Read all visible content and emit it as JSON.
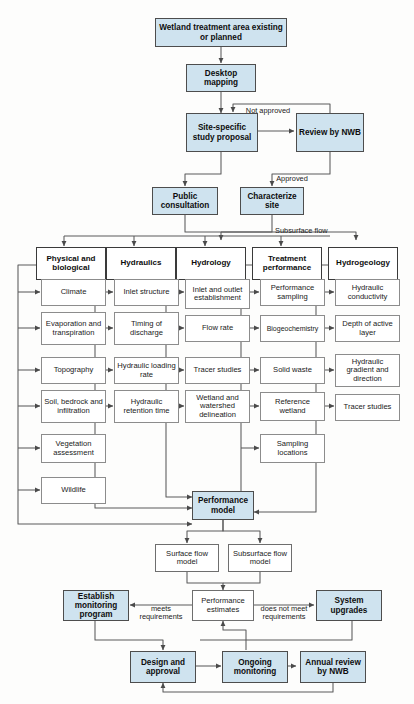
{
  "diagram": {
    "colors": {
      "fill_blue": "#cfe3ef",
      "border_dark": "#4d4d4d",
      "border_light": "#8c8c8c",
      "line": "#555555",
      "background": "#fdfdfc"
    }
  },
  "nodes": {
    "start": "Wetland treatment area existing or planned",
    "desktop_mapping": "Desktop mapping",
    "site_specific": "Site-specific study proposal",
    "review_nwb": "Review by NWB",
    "public_consultation": "Public consultation",
    "characterize_site": "Characterize site",
    "performance_model": "Performance model",
    "surface_flow_model": "Surface flow model",
    "subsurface_flow_model": "Subsurface flow model",
    "performance_estimates": "Performance estimates",
    "establish_monitoring": "Establish monitoring program",
    "system_upgrades": "System upgrades",
    "design_approval": "Design and approval",
    "ongoing_monitoring": "Ongoing monitoring",
    "annual_review": "Annual review by NWB"
  },
  "columns": [
    {
      "header": "Physical and biological",
      "items": [
        "Climate",
        "Evaporation and transpiration",
        "Topography",
        "Soil, bedrock and infiltration",
        "Vegetation assessment",
        "Wildlife"
      ]
    },
    {
      "header": "Hydraulics",
      "items": [
        "Inlet structure",
        "Timing of discharge",
        "Hydraulic loading rate",
        "Hydraulic retention time"
      ]
    },
    {
      "header": "Hydrology",
      "items": [
        "Inlet and outlet establishment",
        "Flow rate",
        "Tracer studies",
        "Wetland and watershed delineation"
      ]
    },
    {
      "header": "Treatment performance",
      "items": [
        "Performance sampling",
        "Biogeochemistry",
        "Solid waste",
        "Reference wetland",
        "Sampling locations"
      ]
    },
    {
      "header": "Hydrogeology",
      "items": [
        "Hydraulic conductivity",
        "Depth of active layer",
        "Hydraulic gradient and direction",
        "Tracer studies"
      ]
    }
  ],
  "edge_labels": {
    "not_approved": "Not approved",
    "approved": "Approved",
    "subsurface_flow": "Subsurface flow",
    "meets_requirements": "meets\nrequirements",
    "does_not_meet": "does not meet\nrequirements"
  }
}
